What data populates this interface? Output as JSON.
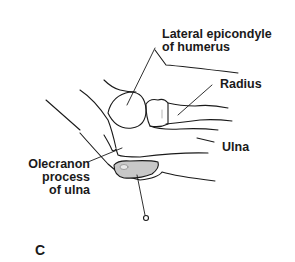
{
  "figure": {
    "panel_label": "C",
    "labels": {
      "lateral_epicondyle": [
        "Lateral epicondyle",
        "of humerus"
      ],
      "radius": "Radius",
      "ulna": "Ulna",
      "olecranon": [
        "Olecranon",
        "process",
        "of ulna"
      ]
    },
    "colors": {
      "line": "#1a1a1a",
      "bursa_fill": "#c8c8c8",
      "background": "#ffffff"
    }
  }
}
